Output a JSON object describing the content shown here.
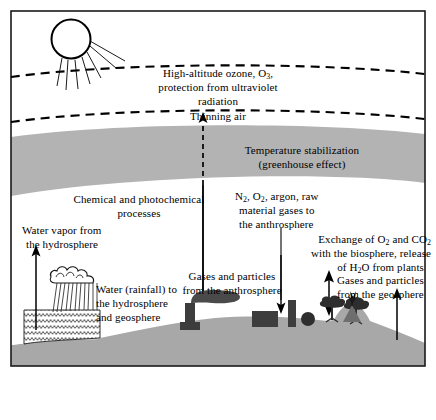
{
  "figure": {
    "frame_color": "#1a1a1a",
    "band_color": "#b3b3b3",
    "ground_color": "#a8a8a8",
    "ink_color": "#000000",
    "background": "#ffffff"
  },
  "labels": {
    "ozone_line1": "High-altitude ozone, O",
    "ozone_sub": "3",
    "ozone_line1_end": ",",
    "ozone_line2": "protection from ultraviolet",
    "ozone_line3": "radiation",
    "thinning_air": "Thinning air",
    "greenhouse_line1": "Temperature stabilization",
    "greenhouse_line2": "(greenhouse effect)",
    "chemical_line1": "Chemical and photochemical",
    "chemical_line2": "processes",
    "water_vapor_line1": "Water vapor from",
    "water_vapor_line2": "the hydrosphere",
    "rainfall_line1": "Water (rainfall) to",
    "rainfall_line2": "the hydrosphere",
    "rainfall_line3": "and geosphere",
    "anthro_gas_line1_a": "N",
    "anthro_gas_line1_sub1": "2",
    "anthro_gas_line1_b": ", O",
    "anthro_gas_line1_sub2": "2",
    "anthro_gas_line1_c": ", argon, raw",
    "anthro_gas_line2": "material gases to",
    "anthro_gas_line3": "the anthrosphere",
    "exchange_line1_a": "Exchange of O",
    "exchange_line1_sub1": "2",
    "exchange_line1_b": " and CO",
    "exchange_line1_sub2": "2",
    "exchange_line2": "with the biosphere, release",
    "exchange_line3_a": "of H",
    "exchange_line3_sub": "2",
    "exchange_line3_b": "O from plants",
    "particles_anthro_line1": "Gases and particles",
    "particles_anthro_line2": "from the anthrosphere",
    "particles_geo_line1": "Gases and particles",
    "particles_geo_line2": "from the geosphere"
  },
  "icons": {
    "sun": "sun-icon",
    "sun_rays": "sun-rays-icon",
    "cloud": "rain-cloud-icon",
    "rain": "rainfall-icon",
    "water": "water-waves-icon",
    "smokestack": "smokestack-icon",
    "smoke": "smoke-plume-icon",
    "factory_building": "factory-building-icon",
    "tower": "factory-tower-icon",
    "dome": "dome-building-icon",
    "tree_left": "tree-icon",
    "tree_right": "tree-icon",
    "volcano": "volcano-icon",
    "ozone_boundary_upper": "dashed-boundary-upper",
    "ozone_boundary_lower": "dashed-boundary-lower",
    "arrow_thinning_air": "thinning-air-arrow",
    "arrow_water_vapor": "water-vapor-arrow",
    "arrow_anthro_down": "anthrosphere-intake-arrow",
    "arrow_biosphere_exchange": "biosphere-exchange-arrow",
    "arrow_geosphere_up": "geosphere-emission-arrow",
    "divider_center": "center-divider-line",
    "divider_right": "right-divider-line"
  }
}
